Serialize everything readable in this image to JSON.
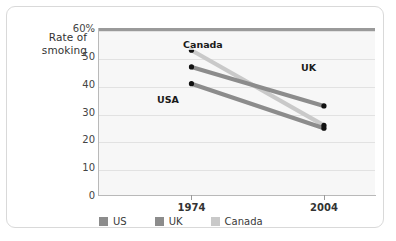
{
  "chart_data": {
    "type": "line",
    "title": "",
    "ylabel_line1": "Rate of",
    "ylabel_line2": "smoking",
    "xlabel": "",
    "x": [
      "1974",
      "2004"
    ],
    "categories": [
      "1974",
      "2004"
    ],
    "yticks": [
      "60%",
      "50",
      "40",
      "30",
      "20",
      "10",
      "0"
    ],
    "ylim": [
      0,
      60
    ],
    "grid": true,
    "legend_position": "bottom-left",
    "series": [
      {
        "name": "US",
        "legend_label": "US",
        "inline_label": "USA",
        "values": [
          40,
          24
        ],
        "color": "#8c8c8c"
      },
      {
        "name": "UK",
        "legend_label": "UK",
        "inline_label": "UK",
        "values": [
          46,
          32
        ],
        "color": "#8c8c8c"
      },
      {
        "name": "Canada",
        "legend_label": "Canada",
        "inline_label": "Canada",
        "values": [
          52,
          25
        ],
        "color": "#c9c9c9"
      }
    ],
    "marker_color": "#111111",
    "plot_background": "#f7f7f7",
    "grid_color": "#e2e2e2",
    "axis_color": "#b9b9b9"
  }
}
